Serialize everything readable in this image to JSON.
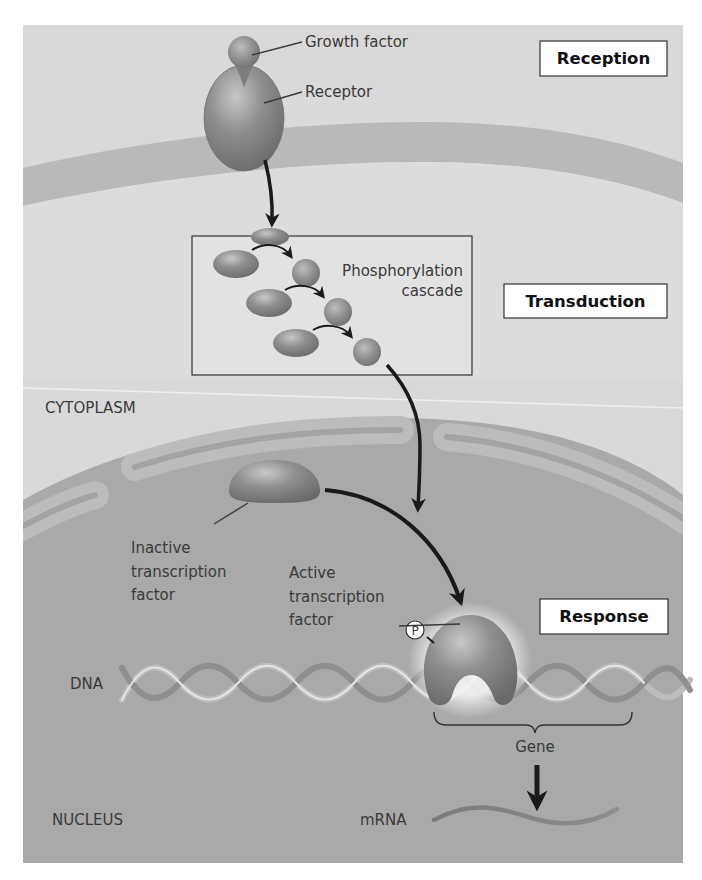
{
  "figure": {
    "colors": {
      "outside_bg": "#d9d9d9",
      "membrane": "#b9b9b9",
      "cytoplasm": "#d2d2d2",
      "nucleus": "#a8a8a8",
      "nuclear_envelope": "#bcbcbc",
      "protein": "#8a8a8a",
      "arrow": "#1a1a1a",
      "stage_box_bg": "#ffffff"
    },
    "stages": [
      {
        "label": "Reception"
      },
      {
        "label": "Transduction"
      },
      {
        "label": "Response"
      }
    ],
    "labels": {
      "growth_factor": "Growth factor",
      "receptor": "Receptor",
      "cascade_line1": "Phosphorylation",
      "cascade_line2": "cascade",
      "cytoplasm": "CYTOPLASM",
      "inactive_line1": "Inactive",
      "inactive_line2": "transcription",
      "inactive_line3": "factor",
      "active_line1": "Active",
      "active_line2": "transcription",
      "active_line3": "factor",
      "phosphate": "P",
      "dna": "DNA",
      "gene": "Gene",
      "nucleus": "NUCLEUS",
      "mrna": "mRNA"
    }
  }
}
